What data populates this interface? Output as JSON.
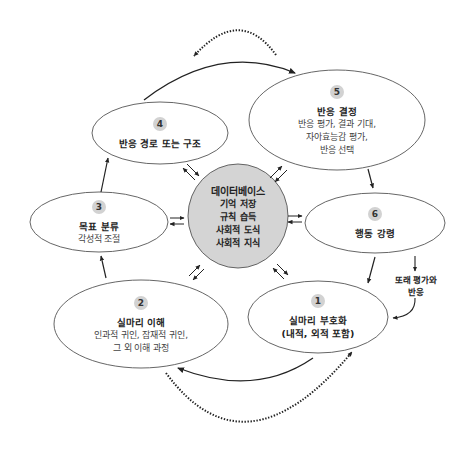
{
  "colors": {
    "stroke": "#555555",
    "arrow": "#222222",
    "database_fill": "#d4d4d4",
    "badge_fill": "#d2d2d2",
    "background": "#ffffff"
  },
  "database": {
    "title": "데이터베이스",
    "items": [
      "기억 저장",
      "규칙 습득",
      "사회적 도식",
      "사회적 지식"
    ]
  },
  "nodes": [
    {
      "number": "1",
      "title": "실마리 부호화",
      "lines": [
        "(내적, 외적 포함)"
      ]
    },
    {
      "number": "2",
      "title": "실마리 이해",
      "lines": [
        "인과적 귀인, 잠재적 귀인,",
        "그 외 이해 과정"
      ]
    },
    {
      "number": "3",
      "title": "목표 분류",
      "lines": [
        "각성적 조절"
      ]
    },
    {
      "number": "4",
      "title": "반응 경로 또는 구조",
      "lines": []
    },
    {
      "number": "5",
      "title": "반응 결정",
      "lines": [
        "반응 평가, 결과 기대,",
        "자아효능감 평가,",
        "반응 선택"
      ]
    },
    {
      "number": "6",
      "title": "행동 강령",
      "lines": []
    }
  ],
  "annotation": {
    "lines": [
      "또래 평가와",
      "반응"
    ]
  }
}
